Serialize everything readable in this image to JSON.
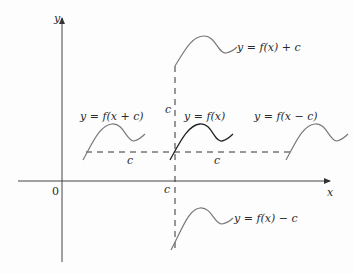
{
  "diagram": {
    "axes": {
      "x_label": "x",
      "y_label": "y",
      "origin_label": "0"
    },
    "shift_labels": {
      "vertical_up": "c",
      "vertical_down": "c",
      "horizontal_left": "c",
      "horizontal_right": "c"
    },
    "curves": [
      {
        "id": "base",
        "label": "y = f(x)"
      },
      {
        "id": "up",
        "label": "y = f(x) + c"
      },
      {
        "id": "down",
        "label": "y = f(x) − c"
      },
      {
        "id": "left",
        "label": "y = f(x + c)"
      },
      {
        "id": "right",
        "label": "y = f(x − c)"
      }
    ],
    "colors": {
      "axis": "#333333",
      "base_curve": "#222222",
      "shifted_curve": "#7a7a7a",
      "dashed": "#333333"
    }
  }
}
